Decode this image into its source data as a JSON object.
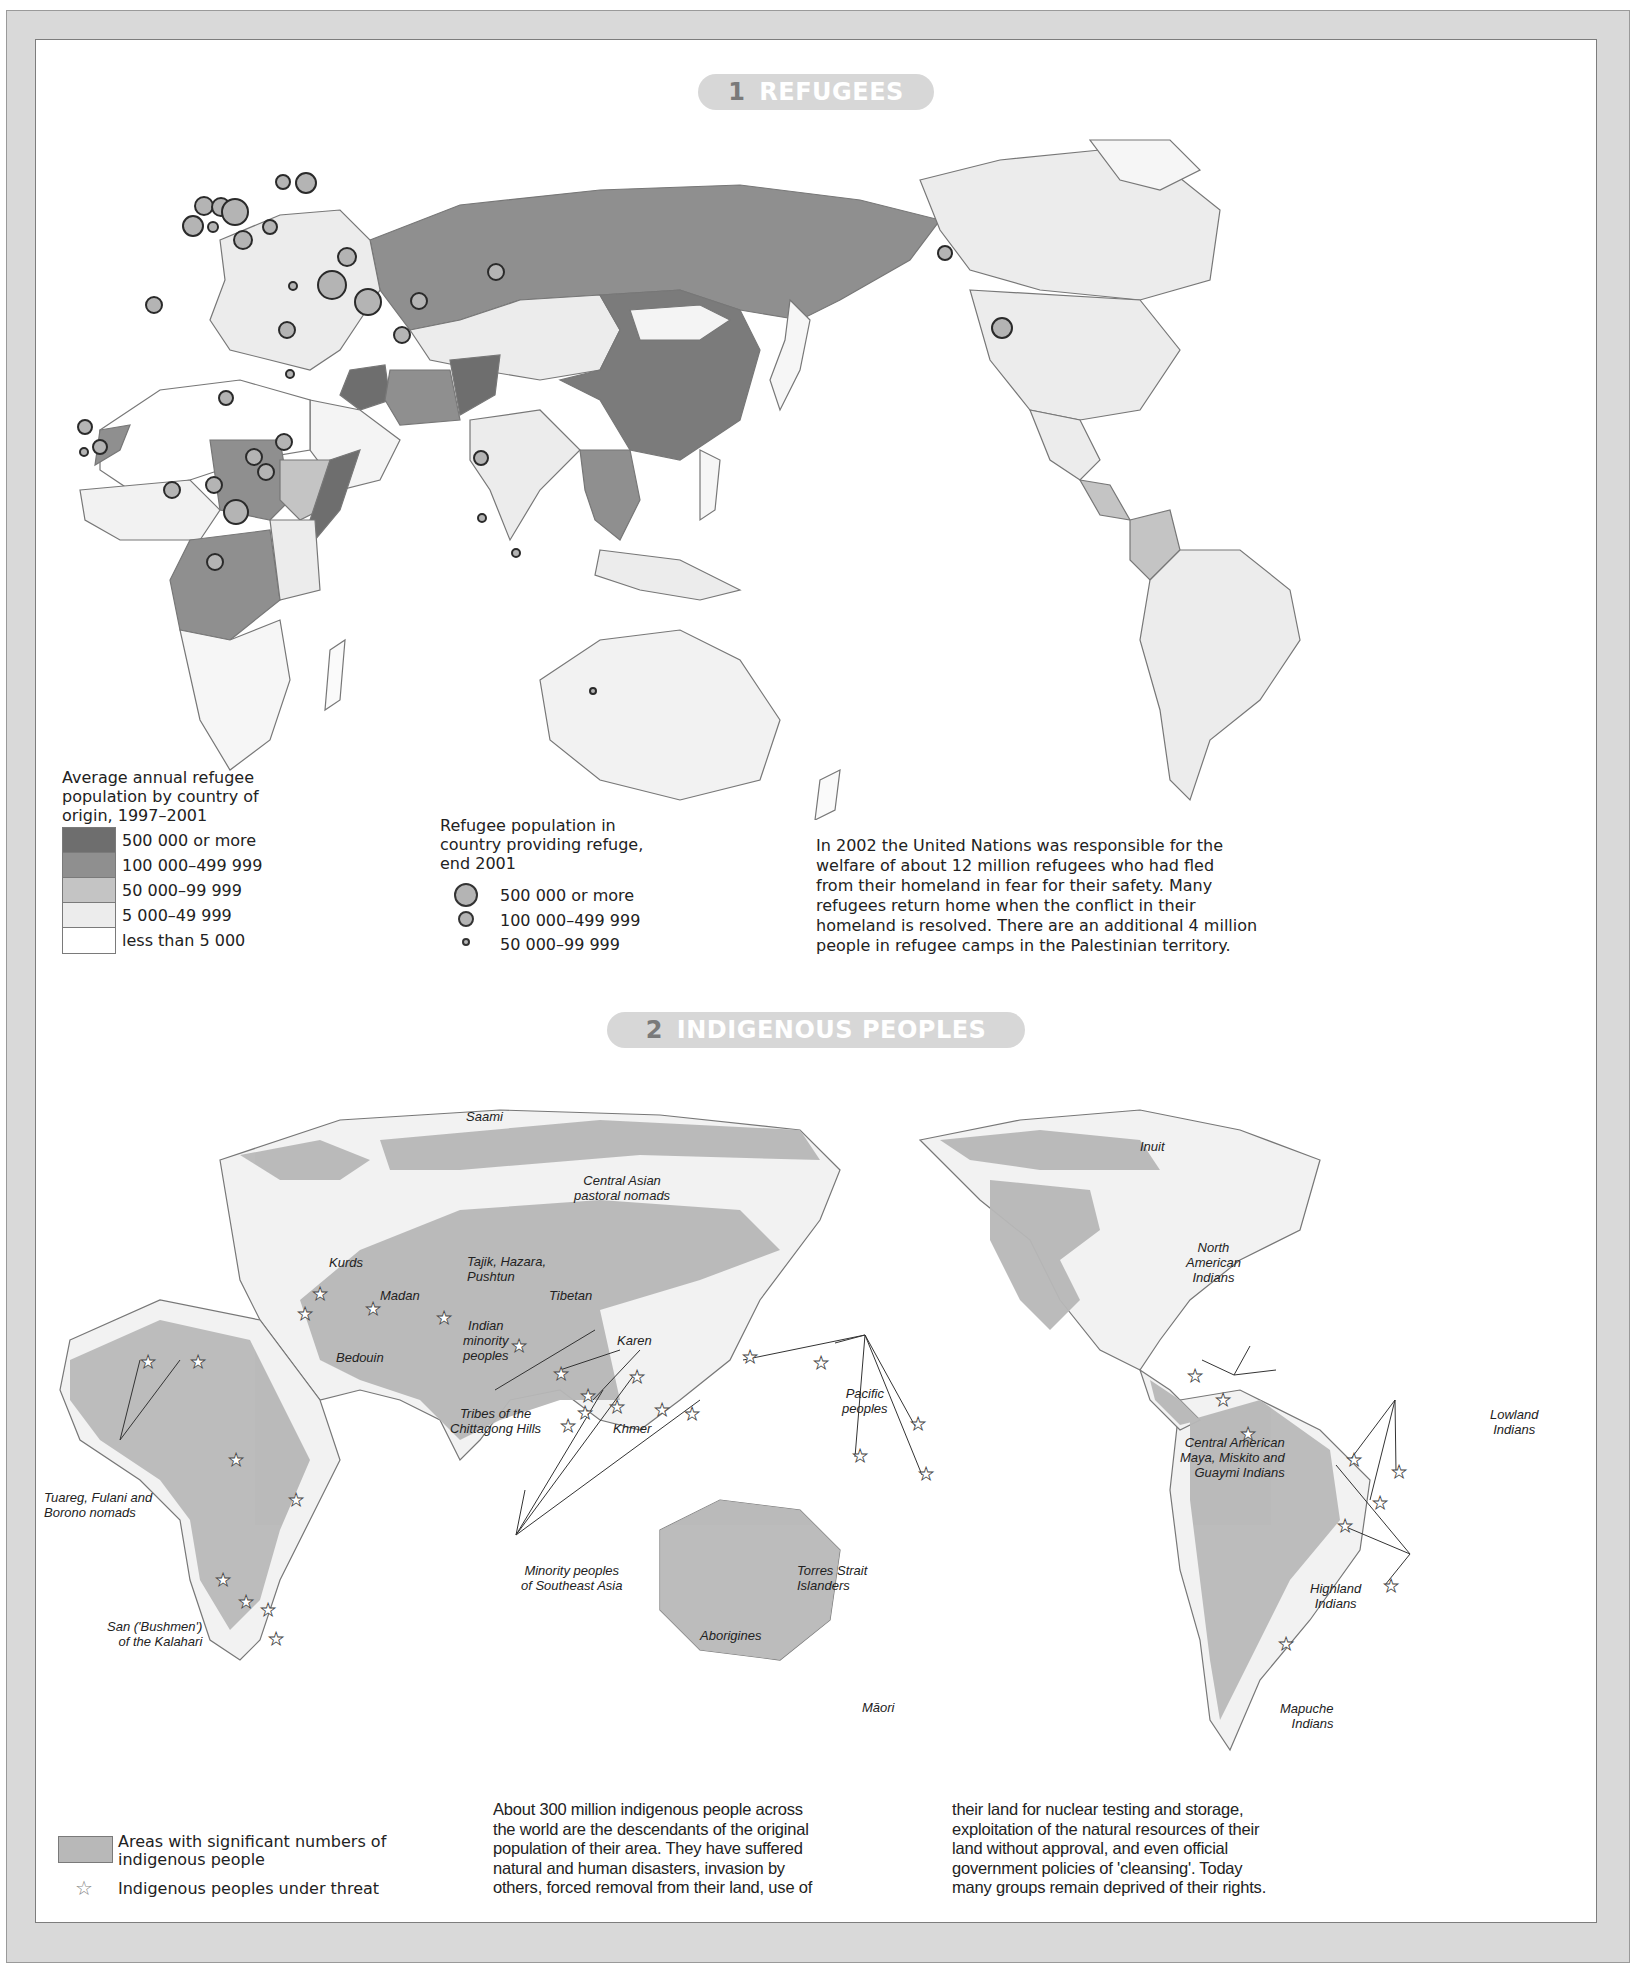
{
  "section1": {
    "number": "1",
    "title": "REFUGEES",
    "legend_origin": {
      "title": "Average annual refugee population by country of origin, 1997–2001",
      "title_lines": [
        "Average annual refugee",
        "population by country of",
        "origin, 1997–2001"
      ],
      "classes": [
        {
          "label": "500 000 or more",
          "color": "#6e6e6e"
        },
        {
          "label": "100 000–499 999",
          "color": "#8f8f8f"
        },
        {
          "label": "50 000–99 999",
          "color": "#c4c4c4"
        },
        {
          "label": "5 000–49 999",
          "color": "#ececec"
        },
        {
          "label": "less than 5 000",
          "color": "#ffffff"
        }
      ]
    },
    "legend_host": {
      "title_lines": [
        "Refugee population in",
        "country providing refuge,",
        "end 2001"
      ],
      "classes": [
        {
          "label": "500 000 or more",
          "size": "large"
        },
        {
          "label": "100 000–499 999",
          "size": "medium"
        },
        {
          "label": "50 000–99 999",
          "size": "small"
        }
      ]
    },
    "paragraph": "In 2002 the United Nations was responsible for the welfare of about 12 million refugees who had fled from their homeland in fear for their safety. Many refugees return home when the conflict in their homeland is resolved. There are an additional 4 million people in refugee camps in the Palestinian territory.",
    "paragraph_lines": [
      "In 2002 the United Nations was responsible for the",
      "welfare of about 12 million refugees who had fled",
      "from their homeland in fear for their safety. Many",
      "refugees return home when the conflict in their",
      "homeland is resolved. There are an additional 4 million",
      "people in refugee camps in the Palestinian territory."
    ]
  },
  "section2": {
    "number": "2",
    "title": "INDIGENOUS PEOPLES",
    "labels": {
      "saami": "Saami",
      "central_asian": [
        "Central Asian",
        "pastoral nomads"
      ],
      "inuit": "Inuit",
      "north_american": [
        "North",
        "American",
        "Indians"
      ],
      "kurds": "Kurds",
      "madan": "Madan",
      "tajik": [
        "Tajik, Hazara,",
        "Pushtun"
      ],
      "tibetan": "Tibetan",
      "indian_minority": [
        "Indian",
        "minority",
        "peoples"
      ],
      "bedouin": "Bedouin",
      "karen": "Karen",
      "tribes_chittagong": [
        "Tribes of the",
        "Chittagong Hills"
      ],
      "khmer": "Khmer",
      "pacific": [
        "Pacific",
        "peoples"
      ],
      "tuareg": [
        "Tuareg, Fulani and",
        "Borono nomads"
      ],
      "central_american": [
        "Central American",
        "Maya, Miskito and",
        "Guaymi Indians"
      ],
      "lowland": [
        "Lowland",
        "Indians"
      ],
      "minority_sea": [
        "Minority peoples",
        "of Southeast Asia"
      ],
      "torres": [
        "Torres Strait",
        "Islanders"
      ],
      "san": [
        "San ('Bushmen')",
        "of the Kalahari"
      ],
      "aborigines": "Aborigines",
      "highland": [
        "Highland",
        "Indians"
      ],
      "maori": "Māori",
      "mapuche": [
        "Mapuche",
        "Indians"
      ]
    },
    "legend": {
      "area_label_lines": [
        "Areas with significant numbers of",
        "indigenous people"
      ],
      "star_label": "Indigenous peoples under threat",
      "area_color": "#b8b8b8"
    },
    "paragraph_col1_lines": [
      "About 300 million indigenous people across",
      "the world are the descendants of the original",
      "population of their area. They have suffered",
      "natural and human disasters, invasion by",
      "others, forced removal from their land, use of"
    ],
    "paragraph_col2_lines": [
      "their land for nuclear testing and storage,",
      "exploitation of the natural resources of their",
      "land without approval, and even official",
      "government policies of 'cleansing'. Today",
      "many groups remain deprived of their rights."
    ]
  },
  "icons": {
    "star": "☆"
  },
  "colors": {
    "frame": "#d9d9d9",
    "pill": "#d7d7d7",
    "land_light": "#ececec",
    "land_mid": "#8f8f8f",
    "land_dark": "#6e6e6e",
    "indigenous_area": "#b8b8b8"
  }
}
